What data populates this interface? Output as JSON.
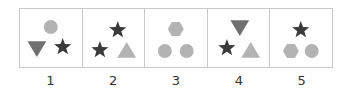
{
  "colors": {
    "dark": "#3b3b3b",
    "medium": "#707070",
    "light": "#b3b3b3",
    "border": "#c8c8c8"
  },
  "panels": [
    {
      "label": "1",
      "shapes": [
        {
          "type": "circle",
          "shade": "light",
          "x": 31,
          "y": 18,
          "size": 7
        },
        {
          "type": "triangle-down",
          "shade": "medium",
          "x": 17,
          "y": 39,
          "size": 9
        },
        {
          "type": "star",
          "shade": "dark",
          "x": 43,
          "y": 38,
          "size": 9
        }
      ]
    },
    {
      "label": "2",
      "shapes": [
        {
          "type": "star",
          "shade": "dark",
          "x": 35,
          "y": 21,
          "size": 9
        },
        {
          "type": "star",
          "shade": "dark",
          "x": 17,
          "y": 41,
          "size": 9
        },
        {
          "type": "triangle-up",
          "shade": "light",
          "x": 44,
          "y": 42,
          "size": 9
        }
      ]
    },
    {
      "label": "3",
      "shapes": [
        {
          "type": "hexagon",
          "shade": "light",
          "x": 31,
          "y": 20,
          "size": 8
        },
        {
          "type": "circle",
          "shade": "light",
          "x": 20,
          "y": 42,
          "size": 7
        },
        {
          "type": "circle",
          "shade": "light",
          "x": 42,
          "y": 42,
          "size": 7
        }
      ]
    },
    {
      "label": "4",
      "shapes": [
        {
          "type": "triangle-down",
          "shade": "medium",
          "x": 32,
          "y": 18,
          "size": 9
        },
        {
          "type": "star",
          "shade": "dark",
          "x": 19,
          "y": 39,
          "size": 9
        },
        {
          "type": "triangle-up",
          "shade": "light",
          "x": 43,
          "y": 42,
          "size": 9
        }
      ]
    },
    {
      "label": "5",
      "shapes": [
        {
          "type": "star",
          "shade": "dark",
          "x": 31,
          "y": 21,
          "size": 9
        },
        {
          "type": "hexagon",
          "shade": "light",
          "x": 21,
          "y": 42,
          "size": 8
        },
        {
          "type": "circle",
          "shade": "light",
          "x": 42,
          "y": 42,
          "size": 7
        }
      ]
    }
  ]
}
